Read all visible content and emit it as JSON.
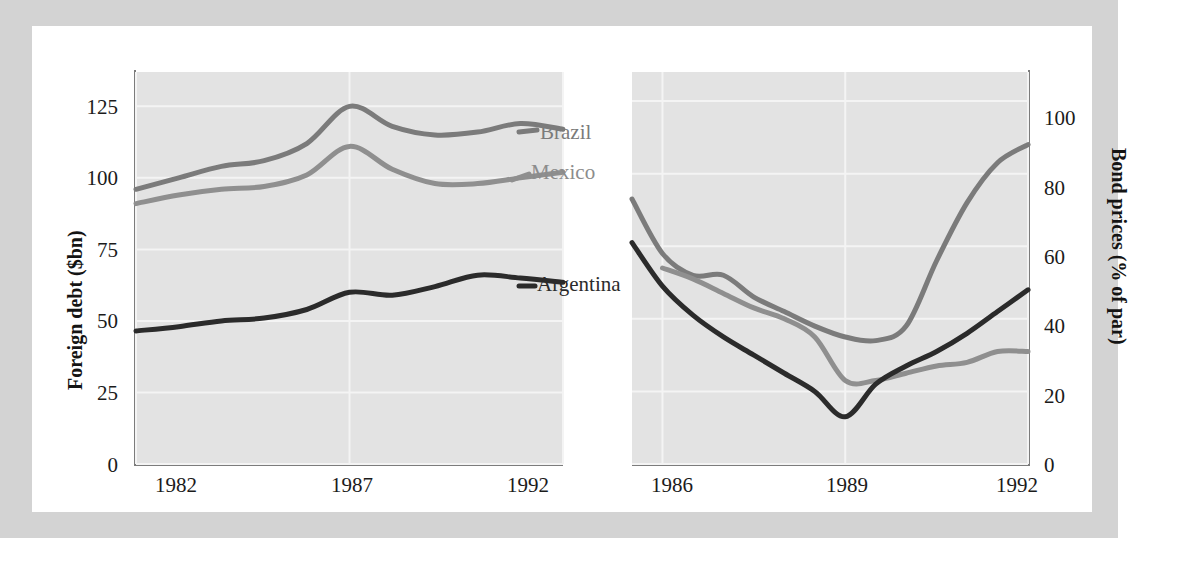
{
  "figure": {
    "background_color": "#d3d3d3",
    "card_color": "#ffffff",
    "plot_color": "#e3e3e3"
  },
  "colors": {
    "brazil": "#7b7b7b",
    "mexico": "#8f8f8f",
    "argentina": "#2b2b2b",
    "gridline": "#f4f4f4",
    "axis": "#7c7c7c",
    "text": "#1b1b1b"
  },
  "labels": {
    "brazil": "Brazil",
    "mexico": "Mexico",
    "argentina": "Argentina"
  },
  "axes": {
    "left_y_title": "Foreign debt ($bn)",
    "right_y_title": "Bond prices (% of par)",
    "left_y_ticks": [
      "0",
      "25",
      "50",
      "75",
      "100",
      "125"
    ],
    "right_y_ticks": [
      "0",
      "20",
      "40",
      "60",
      "80",
      "100"
    ],
    "left_x_ticks": [
      "1982",
      "1987",
      "1992"
    ],
    "right_x_ticks": [
      "1986",
      "1989",
      "1992"
    ]
  },
  "chart_data": {
    "type": "line",
    "title": "",
    "panels": [
      {
        "name": "foreign-debt",
        "ylabel": "Foreign debt ($bn)",
        "xlabel": "",
        "ylim": [
          0,
          137
        ],
        "xlim": [
          1982,
          1992
        ],
        "yticks": [
          0,
          25,
          50,
          75,
          100,
          125
        ],
        "xticks": [
          1982,
          1987,
          1992
        ],
        "grid": true,
        "x": [
          1982,
          1983,
          1984,
          1985,
          1986,
          1987,
          1988,
          1989,
          1990,
          1991,
          1992
        ],
        "series": [
          {
            "name": "Brazil",
            "color": "#7b7b7b",
            "values": [
              96,
              100,
              104,
              106,
              112,
              125,
              118,
              115,
              116,
              119,
              117
            ]
          },
          {
            "name": "Mexico",
            "color": "#8f8f8f",
            "values": [
              91,
              94,
              96,
              97,
              101,
              111,
              103,
              98,
              98,
              100,
              102
            ]
          },
          {
            "name": "Argentina",
            "color": "#2b2b2b",
            "values": [
              46.5,
              48,
              50,
              51,
              54,
              60,
              59,
              62,
              66,
              65,
              63.5
            ]
          }
        ]
      },
      {
        "name": "bond-prices",
        "ylabel": "Bond prices (% of par)",
        "xlabel": "",
        "ylim": [
          0,
          108
        ],
        "xlim": [
          1985.5,
          1992
        ],
        "yticks": [
          0,
          20,
          40,
          60,
          80,
          100
        ],
        "xticks": [
          1986,
          1989,
          1992
        ],
        "grid": true,
        "x": [
          1985.5,
          1986,
          1986.5,
          1987,
          1987.5,
          1988,
          1988.5,
          1989,
          1989.5,
          1990,
          1990.5,
          1991,
          1991.5,
          1992
        ],
        "series": [
          {
            "name": "Brazil",
            "color": "#7b7b7b",
            "values": [
              73,
              58,
              52,
              52,
              46,
              42,
              38,
              35,
              34,
              38,
              56,
              72,
              83,
              88
            ]
          },
          {
            "name": "Mexico",
            "color": "#8f8f8f",
            "values": [
              null,
              54,
              51,
              47,
              43,
              40,
              35,
              23,
              23,
              25,
              27,
              28,
              31,
              31
            ]
          },
          {
            "name": "Argentina",
            "color": "#2b2b2b",
            "values": [
              61,
              49,
              41,
              35,
              30,
              25,
              20,
              13,
              22,
              27,
              31,
              36,
              42,
              48
            ]
          }
        ]
      }
    ],
    "legend": [
      "Brazil",
      "Mexico",
      "Argentina"
    ],
    "legend_position": "in-plot-annotations"
  }
}
